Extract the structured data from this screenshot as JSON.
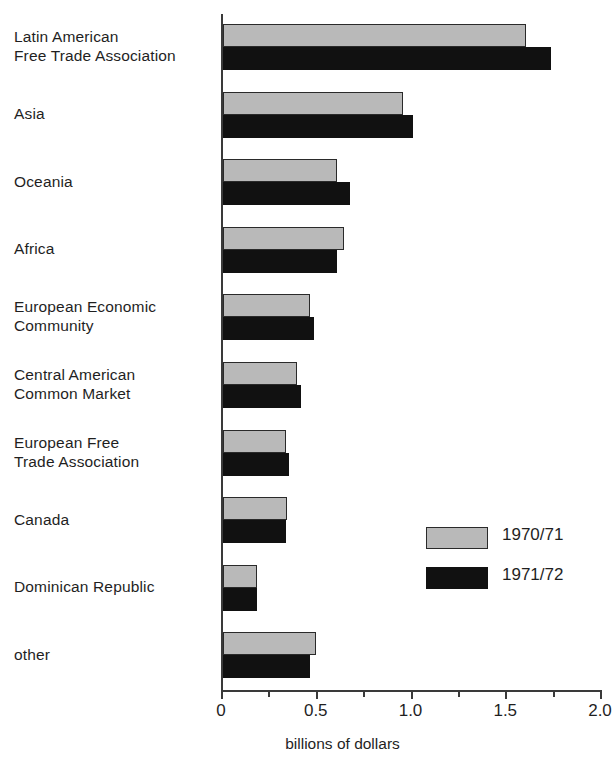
{
  "chart_data": {
    "type": "bar",
    "orientation": "horizontal",
    "title": "",
    "xlabel": "billions of dollars",
    "ylabel": "",
    "xlim": [
      0,
      2.0
    ],
    "grid": false,
    "legend_position": "inside-right",
    "tick_labels": [
      "0",
      "0.5",
      "1.0",
      "1.5",
      "2.0"
    ],
    "tick_values": [
      0,
      0.5,
      1.0,
      1.5,
      2.0
    ],
    "minor_tick_values": [
      0.25,
      0.75,
      1.25,
      1.75
    ],
    "categories": [
      "Latin American\nFree Trade Association",
      "Asia",
      "Oceania",
      "Africa",
      "European Economic\nCommunity",
      "Central American\nCommon Market",
      "European Free\nTrade Association",
      "Canada",
      "Dominican Republic",
      "other"
    ],
    "series": [
      {
        "name": "1970/71",
        "color": "#b9b9b9",
        "values": [
          1.6,
          0.95,
          0.6,
          0.64,
          0.46,
          0.39,
          0.33,
          0.34,
          0.18,
          0.49
        ]
      },
      {
        "name": "1971/72",
        "color": "#111111",
        "values": [
          1.73,
          1.0,
          0.67,
          0.6,
          0.48,
          0.41,
          0.35,
          0.33,
          0.18,
          0.46
        ]
      }
    ]
  },
  "axis": {
    "title": "billions of dollars"
  },
  "legend": {
    "entries": [
      {
        "label": "1970/71",
        "color": "#b9b9b9"
      },
      {
        "label": "1971/72",
        "color": "#111111"
      }
    ]
  }
}
